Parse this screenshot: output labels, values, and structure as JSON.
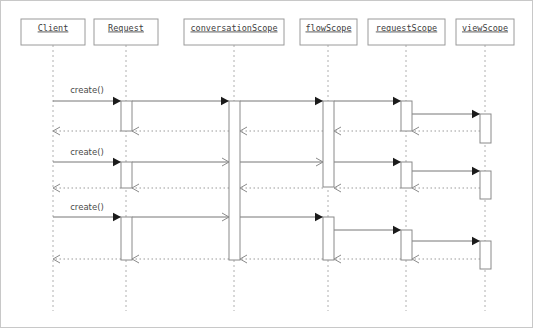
{
  "diagram": {
    "type": "uml-sequence-diagram",
    "canvas": {
      "width": 533,
      "height": 328,
      "background": "#ffffff",
      "border_color": "#c8c8c8"
    },
    "colors": {
      "box_stroke": "#9a9a9a",
      "lifeline": "#b0b0b0",
      "activation_stroke": "#8a8a8a",
      "message_line": "#777777",
      "return_line": "#9a9a9a",
      "arrowhead_solid": "#1b1b1b",
      "label_text": "#404040"
    },
    "participants": [
      {
        "id": "client",
        "label": "Client",
        "box": {
          "x": 20,
          "y": 18,
          "w": 64,
          "h": 26
        },
        "lifeline_x": 52,
        "lifeline_bottom": 310
      },
      {
        "id": "request",
        "label": "Request",
        "box": {
          "x": 93,
          "y": 18,
          "w": 64,
          "h": 26
        },
        "lifeline_x": 125,
        "lifeline_bottom": 310
      },
      {
        "id": "conversationScope",
        "label": "conversationScope",
        "box": {
          "x": 183,
          "y": 18,
          "w": 100,
          "h": 26
        },
        "lifeline_x": 233,
        "lifeline_bottom": 310
      },
      {
        "id": "flowScope",
        "label": "flowScope",
        "box": {
          "x": 299,
          "y": 18,
          "w": 57,
          "h": 26
        },
        "lifeline_x": 327,
        "lifeline_bottom": 310
      },
      {
        "id": "requestScope",
        "label": "requestScope",
        "box": {
          "x": 367,
          "y": 18,
          "w": 77,
          "h": 26
        },
        "lifeline_x": 405,
        "lifeline_bottom": 310
      },
      {
        "id": "viewScope",
        "label": "viewScope",
        "box": {
          "x": 455,
          "y": 18,
          "w": 58,
          "h": 26
        },
        "lifeline_x": 484,
        "lifeline_bottom": 310
      }
    ],
    "activations": [
      {
        "id": "act-request-1",
        "participant": "request",
        "x": 120,
        "y": 100,
        "w": 11,
        "h": 30
      },
      {
        "id": "act-request-2",
        "participant": "request",
        "x": 120,
        "y": 161,
        "w": 11,
        "h": 26
      },
      {
        "id": "act-request-3",
        "participant": "request",
        "x": 120,
        "y": 216,
        "w": 11,
        "h": 43
      },
      {
        "id": "act-conv-1",
        "participant": "conversationScope",
        "x": 228,
        "y": 100,
        "w": 11,
        "h": 159
      },
      {
        "id": "act-flow-1",
        "participant": "flowScope",
        "x": 322,
        "y": 100,
        "w": 11,
        "h": 86
      },
      {
        "id": "act-flow-2",
        "participant": "flowScope",
        "x": 322,
        "y": 216,
        "w": 11,
        "h": 43
      },
      {
        "id": "act-req-1",
        "participant": "requestScope",
        "x": 400,
        "y": 100,
        "w": 11,
        "h": 30
      },
      {
        "id": "act-req-2",
        "participant": "requestScope",
        "x": 400,
        "y": 161,
        "w": 11,
        "h": 26
      },
      {
        "id": "act-req-3",
        "participant": "requestScope",
        "x": 400,
        "y": 229,
        "w": 11,
        "h": 30
      },
      {
        "id": "act-view-1",
        "participant": "viewScope",
        "x": 479,
        "y": 113,
        "w": 11,
        "h": 29
      },
      {
        "id": "act-view-2",
        "participant": "viewScope",
        "x": 479,
        "y": 170,
        "w": 11,
        "h": 28
      },
      {
        "id": "act-view-3",
        "participant": "viewScope",
        "x": 479,
        "y": 240,
        "w": 11,
        "h": 28
      }
    ],
    "messages": [
      {
        "id": "m1-1",
        "label": "create()",
        "from": "client",
        "to": "request",
        "x1": 52,
        "x2": 120,
        "y": 100,
        "kind": "call",
        "head": "solid",
        "label_x": 86,
        "label_y": 89
      },
      {
        "id": "m1-2",
        "label": "",
        "from": "request",
        "to": "conversationScope",
        "x1": 131,
        "x2": 228,
        "y": 100,
        "kind": "call",
        "head": "solid",
        "label_x": 0,
        "label_y": 0
      },
      {
        "id": "m1-3",
        "label": "",
        "from": "conversationScope",
        "to": "flowScope",
        "x1": 239,
        "x2": 322,
        "y": 100,
        "kind": "call",
        "head": "solid",
        "label_x": 0,
        "label_y": 0
      },
      {
        "id": "m1-4",
        "label": "",
        "from": "flowScope",
        "to": "requestScope",
        "x1": 333,
        "x2": 400,
        "y": 100,
        "kind": "call",
        "head": "solid",
        "label_x": 0,
        "label_y": 0
      },
      {
        "id": "m1-5",
        "label": "",
        "from": "requestScope",
        "to": "viewScope",
        "x1": 411,
        "x2": 479,
        "y": 113,
        "kind": "call",
        "head": "solid",
        "label_x": 0,
        "label_y": 0
      },
      {
        "id": "r1-5",
        "label": "",
        "from": "viewScope",
        "to": "requestScope",
        "x1": 479,
        "x2": 411,
        "y": 130,
        "kind": "return",
        "head": "open",
        "label_x": 0,
        "label_y": 0
      },
      {
        "id": "r1-4",
        "label": "",
        "from": "requestScope",
        "to": "flowScope",
        "x1": 400,
        "x2": 333,
        "y": 130,
        "kind": "return",
        "head": "open",
        "label_x": 0,
        "label_y": 0
      },
      {
        "id": "r1-3",
        "label": "",
        "from": "flowScope",
        "to": "conversationScope",
        "x1": 322,
        "x2": 239,
        "y": 130,
        "kind": "return",
        "head": "open",
        "label_x": 0,
        "label_y": 0
      },
      {
        "id": "r1-2",
        "label": "",
        "from": "conversationScope",
        "to": "request",
        "x1": 228,
        "x2": 131,
        "y": 130,
        "kind": "return",
        "head": "open",
        "label_x": 0,
        "label_y": 0
      },
      {
        "id": "r1-1",
        "label": "",
        "from": "request",
        "to": "client",
        "x1": 120,
        "x2": 52,
        "y": 130,
        "kind": "return",
        "head": "open",
        "label_x": 0,
        "label_y": 0
      },
      {
        "id": "m2-1",
        "label": "create()",
        "from": "client",
        "to": "request",
        "x1": 52,
        "x2": 120,
        "y": 161,
        "kind": "call",
        "head": "solid",
        "label_x": 86,
        "label_y": 151
      },
      {
        "id": "m2-2",
        "label": "",
        "from": "request",
        "to": "conversationScope",
        "x1": 131,
        "x2": 228,
        "y": 161,
        "kind": "call",
        "head": "open",
        "label_x": 0,
        "label_y": 0
      },
      {
        "id": "m2-3",
        "label": "",
        "from": "conversationScope",
        "to": "flowScope",
        "x1": 239,
        "x2": 322,
        "y": 161,
        "kind": "call",
        "head": "open",
        "label_x": 0,
        "label_y": 0
      },
      {
        "id": "m2-4",
        "label": "",
        "from": "flowScope",
        "to": "requestScope",
        "x1": 333,
        "x2": 400,
        "y": 161,
        "kind": "call",
        "head": "solid",
        "label_x": 0,
        "label_y": 0
      },
      {
        "id": "m2-5",
        "label": "",
        "from": "requestScope",
        "to": "viewScope",
        "x1": 411,
        "x2": 479,
        "y": 170,
        "kind": "call",
        "head": "solid",
        "label_x": 0,
        "label_y": 0
      },
      {
        "id": "r2-5",
        "label": "",
        "from": "viewScope",
        "to": "requestScope",
        "x1": 479,
        "x2": 411,
        "y": 187,
        "kind": "return",
        "head": "open",
        "label_x": 0,
        "label_y": 0
      },
      {
        "id": "r2-4",
        "label": "",
        "from": "requestScope",
        "to": "flowScope",
        "x1": 400,
        "x2": 333,
        "y": 187,
        "kind": "return",
        "head": "open",
        "label_x": 0,
        "label_y": 0
      },
      {
        "id": "r2-3",
        "label": "",
        "from": "flowScope",
        "to": "conversationScope",
        "x1": 322,
        "x2": 239,
        "y": 187,
        "kind": "return",
        "head": "open",
        "label_x": 0,
        "label_y": 0
      },
      {
        "id": "r2-2",
        "label": "",
        "from": "conversationScope",
        "to": "request",
        "x1": 228,
        "x2": 131,
        "y": 187,
        "kind": "return",
        "head": "open",
        "label_x": 0,
        "label_y": 0
      },
      {
        "id": "r2-1",
        "label": "",
        "from": "request",
        "to": "client",
        "x1": 120,
        "x2": 52,
        "y": 187,
        "kind": "return",
        "head": "open",
        "label_x": 0,
        "label_y": 0
      },
      {
        "id": "m3-1",
        "label": "create()",
        "from": "client",
        "to": "request",
        "x1": 52,
        "x2": 120,
        "y": 216,
        "kind": "call",
        "head": "solid",
        "label_x": 86,
        "label_y": 206
      },
      {
        "id": "m3-2",
        "label": "",
        "from": "request",
        "to": "conversationScope",
        "x1": 131,
        "x2": 228,
        "y": 216,
        "kind": "call",
        "head": "open",
        "label_x": 0,
        "label_y": 0
      },
      {
        "id": "m3-3",
        "label": "",
        "from": "conversationScope",
        "to": "flowScope",
        "x1": 239,
        "x2": 322,
        "y": 216,
        "kind": "call",
        "head": "solid",
        "label_x": 0,
        "label_y": 0
      },
      {
        "id": "m3-4",
        "label": "",
        "from": "flowScope",
        "to": "requestScope",
        "x1": 333,
        "x2": 400,
        "y": 229,
        "kind": "call",
        "head": "solid",
        "label_x": 0,
        "label_y": 0
      },
      {
        "id": "m3-5",
        "label": "",
        "from": "requestScope",
        "to": "viewScope",
        "x1": 411,
        "x2": 479,
        "y": 240,
        "kind": "call",
        "head": "solid",
        "label_x": 0,
        "label_y": 0
      },
      {
        "id": "r3-5",
        "label": "",
        "from": "viewScope",
        "to": "requestScope",
        "x1": 479,
        "x2": 411,
        "y": 258,
        "kind": "return",
        "head": "open",
        "label_x": 0,
        "label_y": 0
      },
      {
        "id": "r3-4",
        "label": "",
        "from": "requestScope",
        "to": "flowScope",
        "x1": 400,
        "x2": 333,
        "y": 258,
        "kind": "return",
        "head": "open",
        "label_x": 0,
        "label_y": 0
      },
      {
        "id": "r3-3",
        "label": "",
        "from": "flowScope",
        "to": "conversationScope",
        "x1": 322,
        "x2": 239,
        "y": 258,
        "kind": "return",
        "head": "open",
        "label_x": 0,
        "label_y": 0
      },
      {
        "id": "r3-2",
        "label": "",
        "from": "conversationScope",
        "to": "request",
        "x1": 228,
        "x2": 131,
        "y": 258,
        "kind": "return",
        "head": "open",
        "label_x": 0,
        "label_y": 0
      },
      {
        "id": "r3-1",
        "label": "",
        "from": "request",
        "to": "client",
        "x1": 120,
        "x2": 52,
        "y": 258,
        "kind": "return",
        "head": "open",
        "label_x": 0,
        "label_y": 0
      }
    ]
  }
}
